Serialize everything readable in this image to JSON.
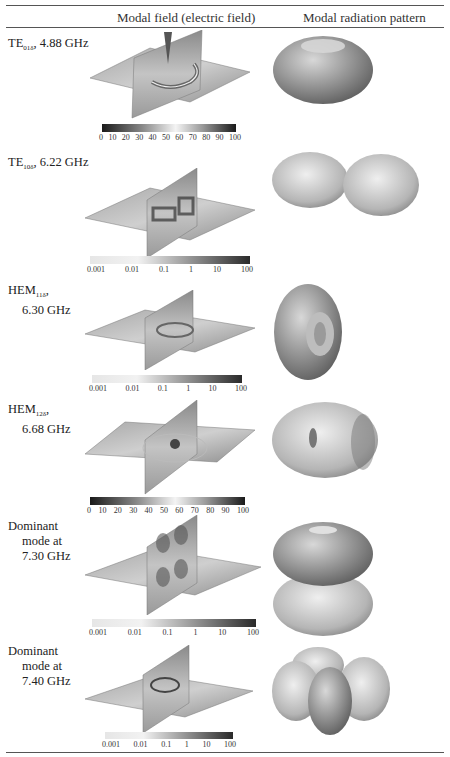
{
  "table": {
    "headers": {
      "label": "",
      "field": "Modal field (electric field)",
      "pattern": "Modal radiation pattern"
    },
    "rows": [
      {
        "mode": "TE",
        "mode_sub": "01δ",
        "freq": "4.88 GHz",
        "label_line1": "TE",
        "label_rest": ", 4.88 GHz",
        "colorbar": {
          "scale": "linear",
          "ticks": [
            "0",
            "10",
            "20",
            "30",
            "40",
            "50",
            "60",
            "70",
            "80",
            "90",
            "100"
          ]
        },
        "pattern_shape": "torus-horizontal"
      },
      {
        "mode": "TE",
        "mode_sub": "10δ",
        "freq": "6.22 GHz",
        "label_line1": "TE",
        "label_rest": ", 6.22 GHz",
        "colorbar": {
          "scale": "log",
          "ticks": [
            "0.001",
            "0.01",
            "0.1",
            "1",
            "10",
            "100"
          ]
        },
        "pattern_shape": "two-lobes-horizontal"
      },
      {
        "mode": "HEM",
        "mode_sub": "11δ",
        "freq": "6.30 GHz",
        "label_line1": "HEM",
        "label_line2": "6.30 GHz",
        "colorbar": {
          "scale": "log",
          "ticks": [
            "0.001",
            "0.01",
            "0.1",
            "1",
            "10",
            "100"
          ]
        },
        "pattern_shape": "torus-side-view"
      },
      {
        "mode": "HEM",
        "mode_sub": "12δ",
        "freq": "6.68 GHz",
        "label_line1": "HEM",
        "label_line2": "6.68 GHz",
        "colorbar": {
          "scale": "linear",
          "ticks": [
            "0",
            "10",
            "20",
            "30",
            "40",
            "50",
            "60",
            "70",
            "80",
            "90",
            "100"
          ]
        },
        "pattern_shape": "dimpled-ellipsoid"
      },
      {
        "mode": "Dominant",
        "freq": "7.30 GHz",
        "label_line1": "Dominant",
        "label_line2": "mode at",
        "label_line3": "7.30 GHz",
        "colorbar": {
          "scale": "log",
          "ticks": [
            "0.001",
            "0.01",
            "0.1",
            "1",
            "10",
            "100"
          ]
        },
        "pattern_shape": "stacked-tori"
      },
      {
        "mode": "Dominant",
        "freq": "7.40 GHz",
        "label_line1": "Dominant",
        "label_line2": "mode at",
        "label_line3": "7.40 GHz",
        "colorbar": {
          "scale": "log",
          "ticks": [
            "0.001",
            "0.01",
            "0.1",
            "1",
            "10",
            "100"
          ]
        },
        "pattern_shape": "four-lobes"
      }
    ]
  }
}
